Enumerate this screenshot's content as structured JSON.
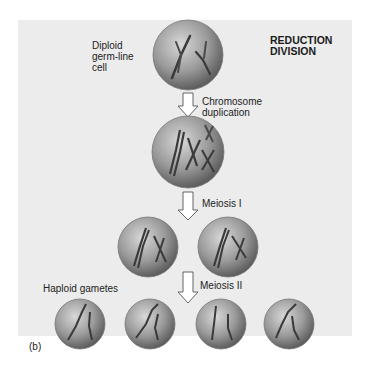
{
  "title": [
    "REDUCTION",
    "DIVISION"
  ],
  "panel_label": "(b)",
  "colors": {
    "panel_bg": "#ececec",
    "cell_fill_light": "#c4c4c4",
    "cell_fill_dark": "#6e6e6e",
    "chromosome": "#3a3a3a",
    "arrow_fill": "#ffffff",
    "arrow_stroke": "#555555"
  },
  "stages": [
    {
      "name": "diploid-germ-line-cell",
      "label": [
        "Diploid",
        "germ-line",
        "cell"
      ]
    },
    {
      "name": "chromosome-duplication",
      "step_label": [
        "Chromosome",
        "duplication"
      ]
    },
    {
      "name": "meiosis-i",
      "step_label": "Meiosis I"
    },
    {
      "name": "meiosis-ii",
      "step_label": "Meiosis II",
      "label": "Haploid gametes"
    }
  ]
}
